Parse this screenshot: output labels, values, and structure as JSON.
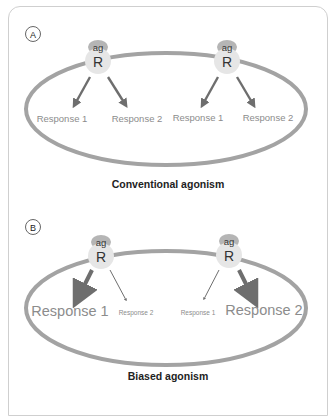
{
  "panels": [
    {
      "label": "A",
      "caption": "Conventional agonism",
      "receptors": [
        {
          "ligand": "ag",
          "receptor": "R",
          "responses": [
            {
              "text": "Response 1",
              "strength": "normal"
            },
            {
              "text": "Response 2",
              "strength": "normal"
            }
          ]
        },
        {
          "ligand": "ag",
          "receptor": "R",
          "responses": [
            {
              "text": "Response 1",
              "strength": "normal"
            },
            {
              "text": "Response 2",
              "strength": "normal"
            }
          ]
        }
      ]
    },
    {
      "label": "B",
      "caption": "Biased agonism",
      "receptors": [
        {
          "ligand": "ag",
          "receptor": "R",
          "responses": [
            {
              "text": "Response 1",
              "strength": "strong"
            },
            {
              "text": "Response 2",
              "strength": "weak"
            }
          ]
        },
        {
          "ligand": "ag",
          "receptor": "R",
          "responses": [
            {
              "text": "Response 1",
              "strength": "weak"
            },
            {
              "text": "Response 2",
              "strength": "strong"
            }
          ]
        }
      ]
    }
  ],
  "colors": {
    "membrane": "#a3a3a3",
    "receptor": "#e6e6e6",
    "ligand": "#b5b5b5",
    "arrow": "#6e6e6e",
    "response_text": "#8c8c8c",
    "caption": "#222222",
    "frame": "#cfcfcf"
  }
}
